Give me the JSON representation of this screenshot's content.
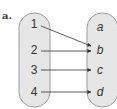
{
  "part_label": "a.",
  "domain": {
    "items": [
      "1",
      "2",
      "3",
      "4"
    ]
  },
  "codomain": {
    "items": [
      "a",
      "b",
      "c",
      "d"
    ]
  },
  "mapping": [
    {
      "from": "1",
      "to": "b"
    },
    {
      "from": "2",
      "to": "b"
    },
    {
      "from": "3",
      "to": "c"
    },
    {
      "from": "4",
      "to": "d"
    }
  ],
  "colors": {
    "oval_fill": "#e6e6e6",
    "oval_stroke": "#888888",
    "arrow": "#333333",
    "text": "#333333"
  }
}
